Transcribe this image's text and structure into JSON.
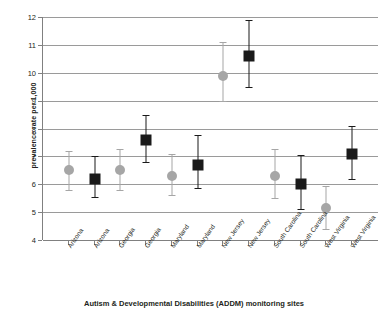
{
  "chart_data": {
    "type": "scatter",
    "title": "",
    "xlabel": "Autism & Developmental Disabilities (ADDM) monitoring sites",
    "ylabel": "prevalence rate per 1,000",
    "ylim": [
      4,
      12
    ],
    "ytick_labels": [
      "4",
      "5",
      "6",
      "7",
      "8",
      "9",
      "10",
      "11",
      "12"
    ],
    "ytick_values": [
      4,
      5,
      6,
      7,
      8,
      9,
      10,
      11,
      12
    ],
    "grid": true,
    "legend": "none",
    "categories": [
      "Arizona",
      "Arizona",
      "Georgia",
      "Georgia",
      "Maryland",
      "Maryland",
      "New Jersey",
      "New Jersey",
      "South Carolina",
      "South Carolina",
      "West Virginia",
      "West Virginia"
    ],
    "points": [
      {
        "label": "Arizona",
        "value": 6.5,
        "ci_low": 5.8,
        "ci_high": 7.2,
        "marker": "circle",
        "color": "#a6a6a6"
      },
      {
        "label": "Arizona",
        "value": 6.2,
        "ci_low": 5.55,
        "ci_high": 7.0,
        "marker": "square",
        "color": "#1a1a1a"
      },
      {
        "label": "Georgia",
        "value": 6.5,
        "ci_low": 5.8,
        "ci_high": 7.25,
        "marker": "circle",
        "color": "#a6a6a6"
      },
      {
        "label": "Georgia",
        "value": 7.6,
        "ci_low": 6.8,
        "ci_high": 8.5,
        "marker": "square",
        "color": "#1a1a1a"
      },
      {
        "label": "Maryland",
        "value": 6.3,
        "ci_low": 5.6,
        "ci_high": 7.1,
        "marker": "circle",
        "color": "#a6a6a6"
      },
      {
        "label": "Maryland",
        "value": 6.7,
        "ci_low": 5.85,
        "ci_high": 7.75,
        "marker": "square",
        "color": "#1a1a1a"
      },
      {
        "label": "New Jersey",
        "value": 9.9,
        "ci_low": 9.0,
        "ci_high": 11.1,
        "marker": "circle",
        "color": "#a6a6a6"
      },
      {
        "label": "New Jersey",
        "value": 10.6,
        "ci_low": 9.5,
        "ci_high": 11.9,
        "marker": "square",
        "color": "#1a1a1a"
      },
      {
        "label": "South Carolina",
        "value": 6.3,
        "ci_low": 5.5,
        "ci_high": 7.25,
        "marker": "circle",
        "color": "#a6a6a6"
      },
      {
        "label": "South Carolina",
        "value": 6.0,
        "ci_low": 5.1,
        "ci_high": 7.05,
        "marker": "square",
        "color": "#1a1a1a"
      },
      {
        "label": "West Virginia",
        "value": 5.15,
        "ci_low": 4.4,
        "ci_high": 5.95,
        "marker": "circle",
        "color": "#a6a6a6"
      },
      {
        "label": "West Virginia",
        "value": 7.1,
        "ci_low": 6.2,
        "ci_high": 8.1,
        "marker": "square",
        "color": "#1a1a1a"
      }
    ],
    "colors": {
      "series_gray": "#a6a6a6",
      "series_black": "#1a1a1a",
      "gridline": "#9a9a9a",
      "axis": "#808080",
      "text": "#231f20",
      "background": "#ffffff"
    }
  }
}
